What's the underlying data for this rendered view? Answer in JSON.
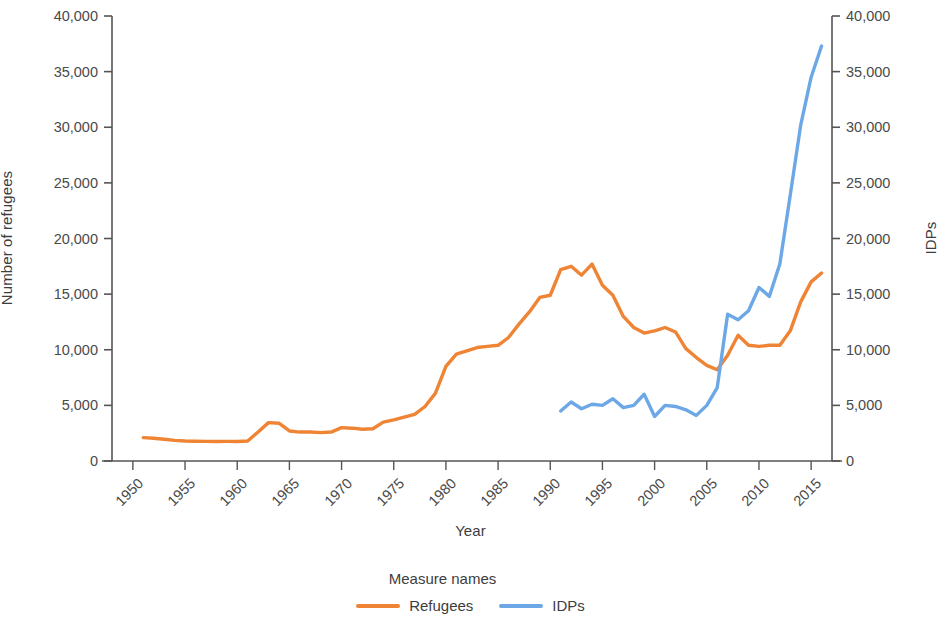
{
  "chart_data": {
    "type": "line",
    "title": "",
    "xlabel": "Year",
    "ylabel": "Number of refugees",
    "y2label": "IDPs",
    "xlim": [
      1948,
      2017
    ],
    "ylim": [
      0,
      40000
    ],
    "y2lim": [
      0,
      40000
    ],
    "grid": false,
    "legend_position": "bottom-center",
    "legend_title": "Measure names",
    "x_tick_labels": [
      "1950",
      "1955",
      "1960",
      "1965",
      "1970",
      "1975",
      "1980",
      "1985",
      "1990",
      "1995",
      "2000",
      "2005",
      "2010",
      "2015"
    ],
    "x_ticks": [
      1950,
      1955,
      1960,
      1965,
      1970,
      1975,
      1980,
      1985,
      1990,
      1995,
      2000,
      2005,
      2010,
      2015
    ],
    "y_tick_labels": [
      "0",
      "5,000",
      "10,000",
      "15,000",
      "20,000",
      "25,000",
      "30,000",
      "35,000",
      "40,000"
    ],
    "y_ticks": [
      0,
      5000,
      10000,
      15000,
      20000,
      25000,
      30000,
      35000,
      40000
    ],
    "y2_tick_labels": [
      "0",
      "5,000",
      "10,000",
      "15,000",
      "20,000",
      "25,000",
      "30,000",
      "35,000",
      "40,000"
    ],
    "y2_ticks": [
      0,
      5000,
      10000,
      15000,
      20000,
      25000,
      30000,
      35000,
      40000
    ],
    "colors": {
      "refugees": "#ee8434",
      "idps": "#6da8e6",
      "axis": "#555555",
      "text": "#3d3d3d"
    },
    "series": [
      {
        "name": "Refugees",
        "axis": "left",
        "color": "#ee8434",
        "x": [
          1951,
          1952,
          1953,
          1954,
          1955,
          1956,
          1957,
          1958,
          1959,
          1960,
          1961,
          1962,
          1963,
          1964,
          1965,
          1966,
          1967,
          1968,
          1969,
          1970,
          1971,
          1972,
          1973,
          1974,
          1975,
          1976,
          1977,
          1978,
          1979,
          1980,
          1981,
          1982,
          1983,
          1984,
          1985,
          1986,
          1987,
          1988,
          1989,
          1990,
          1991,
          1992,
          1993,
          1994,
          1995,
          1996,
          1997,
          1998,
          1999,
          2000,
          2001,
          2002,
          2003,
          2004,
          2005,
          2006,
          2007,
          2008,
          2009,
          2010,
          2011,
          2012,
          2013,
          2014,
          2015,
          2016
        ],
        "values": [
          2100,
          2050,
          1950,
          1850,
          1800,
          1780,
          1760,
          1750,
          1760,
          1750,
          1800,
          2600,
          3450,
          3400,
          2700,
          2600,
          2600,
          2550,
          2600,
          3000,
          2950,
          2850,
          2900,
          3500,
          3700,
          3950,
          4200,
          4900,
          6100,
          8500,
          9600,
          9900,
          10200,
          10300,
          10400,
          11100,
          12300,
          13400,
          14700,
          14900,
          17200,
          17500,
          16700,
          17700,
          15800,
          14900,
          13000,
          12000,
          11500,
          11700,
          12000,
          11600,
          10100,
          9300,
          8600,
          8200,
          9500,
          11300,
          10400,
          10300,
          10400,
          10400,
          11700,
          14300,
          16100,
          16900
        ]
      },
      {
        "name": "IDPs",
        "axis": "right",
        "color": "#6da8e6",
        "x": [
          1991,
          1992,
          1993,
          1994,
          1995,
          1996,
          1997,
          1998,
          1999,
          2000,
          2001,
          2002,
          2003,
          2004,
          2005,
          2006,
          2007,
          2008,
          2009,
          2010,
          2011,
          2012,
          2013,
          2014,
          2015,
          2016
        ],
        "values": [
          4500,
          5300,
          4700,
          5100,
          5000,
          5600,
          4800,
          5000,
          6000,
          4000,
          5000,
          4900,
          4600,
          4100,
          5000,
          6600,
          13200,
          12700,
          13500,
          15600,
          14800,
          17700,
          23900,
          30200,
          34500,
          37300
        ]
      }
    ]
  },
  "axes": {
    "left_title": "Number of refugees",
    "right_title": "IDPs",
    "x_title": "Year"
  },
  "legend": {
    "title": "Measure names",
    "items": [
      {
        "label": "Refugees",
        "color": "#ee8434"
      },
      {
        "label": "IDPs",
        "color": "#6da8e6"
      }
    ]
  }
}
